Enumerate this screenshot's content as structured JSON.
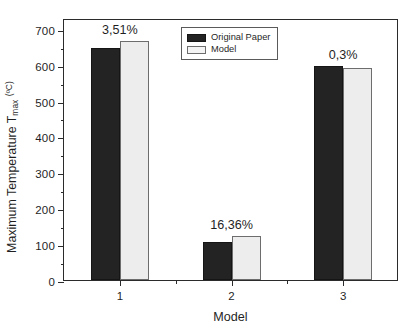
{
  "chart_data": {
    "type": "bar",
    "title": "",
    "xlabel": "Model",
    "ylabel": "Maximum Temperature T_max (°C)",
    "ylabel_parts": {
      "main": "Maximum Temperature T",
      "subscript": "max",
      "units": "(ºC)"
    },
    "categories": [
      "1",
      "2",
      "3"
    ],
    "series": [
      {
        "name": "Original Paper",
        "color": "#232323",
        "values": [
          646,
          107,
          595
        ]
      },
      {
        "name": "Model",
        "color": "#ededed",
        "values": [
          666,
          122,
          592
        ]
      }
    ],
    "annotations": [
      {
        "category": "1",
        "text": "3,51%"
      },
      {
        "category": "2",
        "text": "16,36%"
      },
      {
        "category": "3",
        "text": "0,3%"
      }
    ],
    "ylim": [
      0,
      730
    ],
    "y_ticks": [
      0,
      100,
      200,
      300,
      400,
      500,
      600,
      700
    ],
    "y_tick_labels": [
      "0",
      "100",
      "200",
      "300",
      "400",
      "500",
      "600",
      "700"
    ],
    "y_minor_ticks": [
      50,
      150,
      250,
      350,
      450,
      550,
      650
    ],
    "grid": false,
    "legend_position": "top-center",
    "legend": [
      {
        "label": "Original Paper",
        "swatch": "dark"
      },
      {
        "label": "Model",
        "swatch": "light"
      }
    ]
  }
}
